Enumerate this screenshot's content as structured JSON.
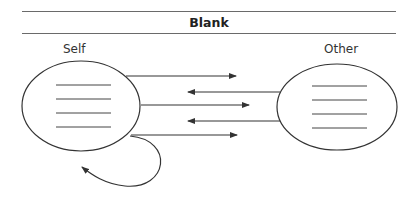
{
  "header": {
    "title": "Blank"
  },
  "nodes": {
    "self": {
      "label": "Self",
      "line_count": 4
    },
    "other": {
      "label": "Other",
      "line_count": 4
    }
  },
  "arrows": [
    {
      "from": "self",
      "to": "other",
      "y": 76
    },
    {
      "from": "other",
      "to": "self",
      "y": 92
    },
    {
      "from": "self",
      "to": "other",
      "y": 105
    },
    {
      "from": "other",
      "to": "self",
      "y": 121
    },
    {
      "from": "self",
      "to": "other",
      "y": 135
    },
    {
      "from": "self",
      "to": "self",
      "type": "loop"
    }
  ],
  "colors": {
    "stroke": "#333333",
    "rule": "#6a6a6a"
  }
}
